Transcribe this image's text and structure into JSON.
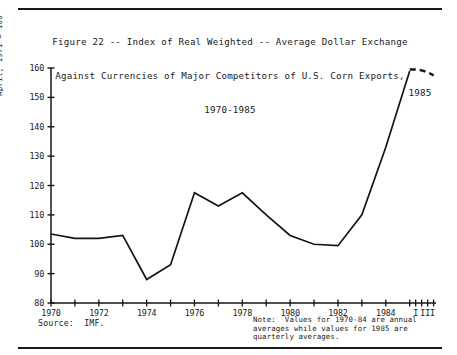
{
  "figure": {
    "title_lines": [
      "Figure 22 -- Index of Real Weighted -- Average Dollar Exchange",
      "Against Currencies of Major Competitors of U.S. Corn Exports,",
      "1970-1985"
    ],
    "source_text": "Source:  IMF.",
    "note_lines": [
      "Note:  Values for 1970-84 are annual",
      "averages while values for 1985 are",
      "quarterly averages."
    ],
    "series_annotation": "1985",
    "line_color": "#141414",
    "background_color": "#ffffff"
  },
  "chart_data": {
    "type": "line",
    "title": "Figure 22 -- Index of Real Weighted -- Average Dollar Exchange Against Currencies of Major Competitors of U.S. Corn Exports, 1970-1985",
    "xlabel": "",
    "ylabel": "April, 1971 = 100",
    "ylim": [
      80,
      160
    ],
    "ytick_values": [
      80,
      90,
      100,
      110,
      120,
      130,
      140,
      150,
      160
    ],
    "ytick_labels": [
      "80",
      "90",
      "100",
      "110",
      "120",
      "130",
      "140",
      "150",
      "160"
    ],
    "xtick_labels": [
      "1970",
      "1972",
      "1974",
      "1976",
      "1978",
      "1980",
      "1982",
      "1984",
      "I",
      "III"
    ],
    "xtick_x": [
      1970,
      1972,
      1974,
      1976,
      1978,
      1980,
      1982,
      1984,
      1985.25,
      1985.75
    ],
    "xlim": [
      1970,
      1986.1
    ],
    "grid": false,
    "legend": "none",
    "series": [
      {
        "name": "Annual averages 1970-1984",
        "style": "solid",
        "x": [
          1970,
          1971,
          1972,
          1973,
          1974,
          1975,
          1976,
          1977,
          1978,
          1979,
          1980,
          1981,
          1982,
          1983,
          1984,
          1985
        ],
        "values": [
          103.5,
          102.0,
          102.0,
          103.0,
          88.0,
          93.0,
          117.5,
          113.0,
          117.5,
          110.0,
          103.0,
          100.0,
          99.5,
          110.0,
          133.0,
          159.0
        ]
      },
      {
        "name": "1985 quarterly averages",
        "style": "dashed",
        "x": [
          1985.0,
          1985.25,
          1985.5,
          1985.75,
          1986.0
        ],
        "values": [
          159.5,
          159.5,
          159.2,
          158.6,
          157.5
        ]
      }
    ],
    "annotations": [
      {
        "text": "1985",
        "x": 1985.45,
        "y": 151.5
      }
    ]
  }
}
